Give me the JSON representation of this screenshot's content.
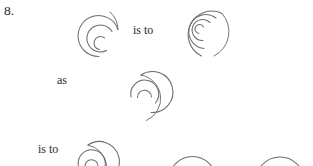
{
  "item": {
    "number": "8."
  },
  "connectors": {
    "is_to_first": "is to",
    "as": "as",
    "is_to_second": "is to"
  },
  "figures": [
    {
      "id": "figure-a",
      "name": "spiral-figure-a",
      "role": "analogy-term-a",
      "description": "open spiral, two and a half turns, opening at bottom",
      "turns": 2.5,
      "stroke": "#6c6c72"
    },
    {
      "id": "figure-b",
      "name": "spiral-figure-b",
      "role": "analogy-term-b",
      "description": "dense spiral, three and a half turns, opening at bottom right",
      "turns": 3.5,
      "stroke": "#6c6c72"
    },
    {
      "id": "figure-c",
      "name": "spiral-figure-c",
      "role": "analogy-term-c",
      "description": "open spiral, two and a half turns, opening to the right",
      "turns": 2.5,
      "stroke": "#6c6c72"
    },
    {
      "id": "figure-d",
      "name": "spiral-answer-option-1",
      "role": "answer-option",
      "description": "spiral top, clipped by bottom page edge",
      "turns": 2.5,
      "stroke": "#6c6c72"
    },
    {
      "id": "figure-e",
      "name": "spiral-answer-option-2",
      "role": "answer-option",
      "description": "large arc top, clipped by bottom page edge",
      "turns": 1.5,
      "stroke": "#6c6c72"
    },
    {
      "id": "figure-f",
      "name": "spiral-answer-option-3",
      "role": "answer-option",
      "description": "arc top, clipped by bottom page and right edge",
      "turns": 1.5,
      "stroke": "#6c6c72"
    }
  ],
  "colors": {
    "background": "#ffffff",
    "ink": "#282828",
    "stroke": "#6c6c72"
  }
}
